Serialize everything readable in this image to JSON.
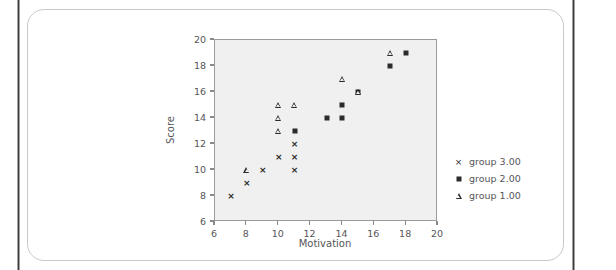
{
  "chart_data": {
    "type": "scatter",
    "title": "",
    "xlabel": "Motivation",
    "ylabel": "Score",
    "xlim": [
      6,
      20
    ],
    "ylim": [
      6,
      20
    ],
    "xticks": [
      6,
      8,
      10,
      12,
      14,
      16,
      18,
      20
    ],
    "yticks": [
      6,
      8,
      10,
      12,
      14,
      16,
      18,
      20
    ],
    "grid": false,
    "legend_position": "right",
    "plot_background": "#f0f0f0",
    "marker_color": "#2b2b2b",
    "series": [
      {
        "name": "group 3.00",
        "marker": "cross",
        "glyph": "×",
        "points": [
          [
            7,
            8
          ],
          [
            8,
            9
          ],
          [
            9,
            10
          ],
          [
            10,
            11
          ],
          [
            11,
            10
          ],
          [
            11,
            11
          ],
          [
            11,
            12
          ]
        ]
      },
      {
        "name": "group 2.00",
        "marker": "square",
        "glyph": "■",
        "points": [
          [
            11,
            13
          ],
          [
            13,
            14
          ],
          [
            14,
            14
          ],
          [
            14,
            15
          ],
          [
            15,
            16
          ],
          [
            17,
            18
          ],
          [
            18,
            19
          ]
        ]
      },
      {
        "name": "group 1.00",
        "marker": "triangle",
        "glyph": "△",
        "points": [
          [
            8,
            10
          ],
          [
            10,
            13
          ],
          [
            10,
            14
          ],
          [
            10,
            15
          ],
          [
            11,
            15
          ],
          [
            14,
            17
          ],
          [
            15,
            16
          ],
          [
            17,
            19
          ]
        ]
      }
    ]
  }
}
